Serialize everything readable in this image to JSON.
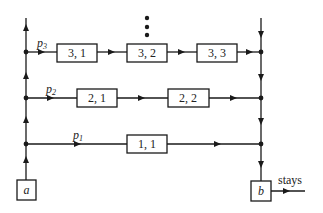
{
  "diagram": {
    "start_node": {
      "label": "a"
    },
    "end_node": {
      "label": "b",
      "exit_label": "stays"
    },
    "paths": [
      {
        "name": "p",
        "sub": "3",
        "y": 52,
        "boxes": [
          {
            "label": "3, 1",
            "x": 57
          },
          {
            "label": "3, 2",
            "x": 127
          },
          {
            "label": "3, 3",
            "x": 197
          }
        ]
      },
      {
        "name": "p",
        "sub": "2",
        "y": 98,
        "boxes": [
          {
            "label": "2, 1",
            "x": 77
          },
          {
            "label": "2, 2",
            "x": 168
          }
        ]
      },
      {
        "name": "p",
        "sub": "1",
        "y": 144,
        "boxes": [
          {
            "label": "1, 1",
            "x": 127
          }
        ]
      }
    ],
    "ellipsis": "⋮",
    "line_color": "#1a1a1a"
  }
}
